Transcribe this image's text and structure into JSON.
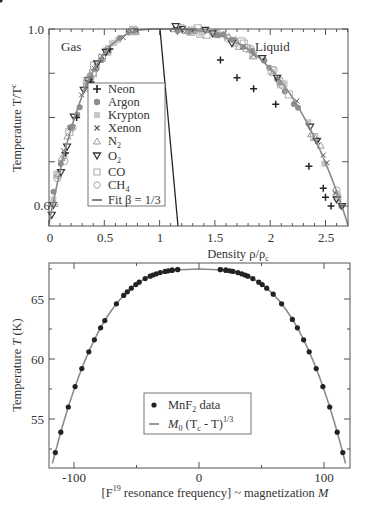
{
  "chart_data": [
    {
      "type": "scatter",
      "title": "",
      "xlabel": "Density ρ/ρc",
      "ylabel": "Temperature T/Tc",
      "xlim": [
        0,
        2.7
      ],
      "ylim": [
        0.56,
        1.0
      ],
      "xticks": [
        "0",
        "0.5",
        "1",
        "1.5",
        "2",
        "2.5"
      ],
      "yticks": [
        "0.6",
        "1.0"
      ],
      "annotations": [
        "Gas",
        "Liquid"
      ],
      "legend_position": "inside-left",
      "grid": false,
      "series": [
        {
          "name": "Neon",
          "marker": "plus"
        },
        {
          "name": "Argon",
          "marker": "filled-circle"
        },
        {
          "name": "Krypton",
          "marker": "filled-square"
        },
        {
          "name": "Xenon",
          "marker": "x"
        },
        {
          "name": "N2",
          "marker": "triangle-up"
        },
        {
          "name": "O2",
          "marker": "triangle-down"
        },
        {
          "name": "CO",
          "marker": "open-square"
        },
        {
          "name": "CH4",
          "marker": "open-circle"
        },
        {
          "name": "Fit β = 1/3",
          "marker": "line"
        }
      ],
      "coexistence_curve": {
        "gas_branch": {
          "x": [
            0.0,
            0.05,
            0.1,
            0.2,
            0.3,
            0.45,
            0.6,
            0.8,
            1.0
          ],
          "y": [
            0.56,
            0.65,
            0.72,
            0.82,
            0.88,
            0.94,
            0.975,
            0.995,
            1.0
          ]
        },
        "liquid_branch": {
          "x": [
            1.0,
            1.2,
            1.45,
            1.7,
            1.95,
            2.2,
            2.4,
            2.55,
            2.7
          ],
          "y": [
            1.0,
            0.995,
            0.975,
            0.94,
            0.88,
            0.8,
            0.72,
            0.64,
            0.56
          ]
        }
      },
      "rectilinear_diameter": {
        "x": [
          1.0,
          1.33
        ],
        "y": [
          1.0,
          0.56
        ]
      },
      "neon_outliers": {
        "x": [
          2.35,
          2.48,
          2.5,
          2.55
        ],
        "y": [
          0.69,
          0.64,
          0.62,
          0.6
        ]
      }
    },
    {
      "type": "scatter",
      "title": "",
      "xlabel": "[F19 resonance frequency] ~ magnetization M",
      "ylabel": "Temperature T (K)",
      "xlim": [
        -120,
        120
      ],
      "ylim": [
        51,
        68
      ],
      "xticks": [
        "-100",
        "0",
        "100"
      ],
      "yticks": [
        "55",
        "60",
        "65"
      ],
      "legend_position": "lower-center",
      "grid": false,
      "series": [
        {
          "name": "MnF2 data",
          "marker": "filled-circle",
          "x": [
            -115,
            -110,
            -105,
            -100,
            -96,
            -92,
            -88,
            -83,
            -78,
            -74,
            -70,
            -63,
            -57,
            -52,
            -48,
            -44,
            -40,
            -36,
            -32,
            -28,
            -24,
            -20,
            -16,
            -12,
            -8,
            -4,
            4,
            8,
            12,
            16,
            20,
            24,
            28,
            32,
            36,
            40,
            44,
            48,
            52,
            57,
            63,
            70,
            74,
            78,
            83,
            88,
            92,
            96,
            100,
            105,
            110,
            115
          ],
          "y": [
            52.2,
            53.9,
            56.0,
            57.7,
            59.2,
            60.6,
            61.6,
            62.6,
            63.2,
            64.6,
            65.3,
            65.6,
            65.9,
            66.2,
            66.4,
            66.7,
            66.9,
            67.0,
            67.1,
            67.2,
            67.3,
            67.35,
            67.4,
            67.4,
            67.45,
            67.45,
            67.45,
            67.45,
            67.4,
            67.4,
            67.35,
            67.3,
            67.2,
            67.1,
            67.0,
            66.9,
            66.7,
            66.4,
            66.2,
            65.9,
            65.4,
            64.6,
            63.3,
            62.6,
            61.6,
            60.6,
            59.2,
            57.7,
            56.0,
            53.9,
            52.2
          ]
        },
        {
          "name": "M0 (Tc - T)^1/3",
          "marker": "line"
        }
      ]
    }
  ],
  "top_chart": {
    "annotations": {
      "gas": "Gas",
      "liquid": "Liquid"
    },
    "xlabel": "Density ρ/ρ",
    "xlabel_sub": "c",
    "ylabel": "Temperature T/T",
    "ylabel_sub": "c",
    "xticks": [
      "0",
      "0.5",
      "1",
      "1.5",
      "2",
      "2.5"
    ],
    "yticks": [
      "1.0",
      "0.6"
    ],
    "legend": [
      {
        "label": "Neon",
        "sub": ""
      },
      {
        "label": "Argon",
        "sub": ""
      },
      {
        "label": "Krypton",
        "sub": ""
      },
      {
        "label": "Xenon",
        "sub": ""
      },
      {
        "label": "N",
        "sub": "2"
      },
      {
        "label": "O",
        "sub": "2"
      },
      {
        "label": "CO",
        "sub": ""
      },
      {
        "label": "CH",
        "sub": "4"
      },
      {
        "label": "Fit β = 1/3",
        "sub": ""
      }
    ]
  },
  "bottom_chart": {
    "xlabel_pre": "[F",
    "xlabel_sup": "19",
    "xlabel_post": " resonance frequency] ~ magnetization ",
    "xlabel_var": "M",
    "ylabel_pre": "Temperature ",
    "ylabel_var": "T",
    "ylabel_post": " (K)",
    "xticks": [
      "-100",
      "0",
      "100"
    ],
    "yticks": [
      "65",
      "60",
      "55"
    ],
    "legend": {
      "data_pre": "MnF",
      "data_sub": "2",
      "data_post": " data",
      "fit_var": "M",
      "fit_sub": "0",
      "fit_mid": " (T",
      "fit_sub2": "c",
      "fit_post": " - T)",
      "fit_sup": "1/3"
    }
  },
  "colors": {
    "axis": "#555555",
    "curve": "#888888",
    "fit_line": "#222222",
    "marker_dark": "#222222",
    "marker_gray": "#9a9a9a",
    "marker_light": "#c4c4c4"
  }
}
